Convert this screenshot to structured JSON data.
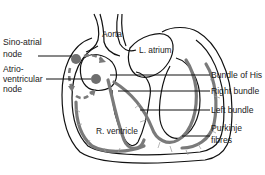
{
  "diagram": {
    "labels": {
      "aorta": "Aorta",
      "l_atrium": "L. atrium",
      "r_ventricle": "R. ventricle",
      "sa_node_line1": "Sino-atrial",
      "sa_node_line2": "node",
      "av_node_line1": "Atrio-",
      "av_node_line2": "ventricular",
      "av_node_line3": "node",
      "bundle_of_his": "Bundle of His",
      "right_bundle": "Right bundle",
      "left_bundle": "Left bundle",
      "purkinje_line1": "Purkinje",
      "purkinje_line2": "fibres"
    },
    "colors": {
      "outline": "#111111",
      "conduction_pathway": "#7a7a7a",
      "background": "#ffffff"
    }
  }
}
